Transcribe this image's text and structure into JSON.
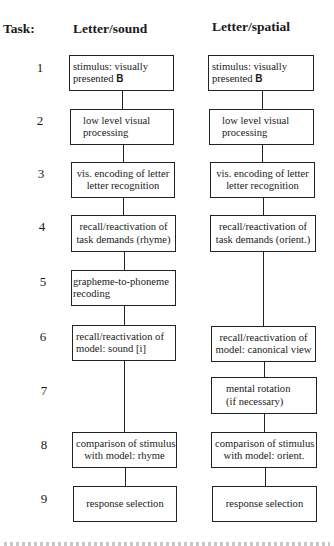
{
  "headers": {
    "task": "Task:",
    "left_column": "Letter/sound",
    "right_column": "Letter/spatial"
  },
  "task_numbers": [
    "1",
    "2",
    "3",
    "4",
    "5",
    "6",
    "7",
    "8",
    "9"
  ],
  "left_column_steps": [
    {
      "task": "1",
      "line1": "stimulus:  visually",
      "line2_prefix": "presented ",
      "line2_bold": "B"
    },
    {
      "task": "2",
      "line1": "low  level  visual",
      "line2": "processing"
    },
    {
      "task": "3",
      "line1": "vis. encoding of letter",
      "line2": "letter  recognition"
    },
    {
      "task": "4",
      "line1": "recall/reactivation  of",
      "line2": "task demands (rhyme)"
    },
    {
      "task": "5",
      "line1": "grapheme-to-phoneme",
      "line2": "recoding"
    },
    {
      "task": "6",
      "line1": "recall/reactivation   of",
      "line2": "model: sound [i]"
    },
    {
      "task": "8",
      "line1": "comparison of stimulus",
      "line2": "with model:  rhyme"
    },
    {
      "task": "9",
      "line1": "response selection"
    }
  ],
  "right_column_steps": [
    {
      "task": "1",
      "line1": "stimulus:  visually",
      "line2_prefix": "presented ",
      "line2_bold": "B"
    },
    {
      "task": "2",
      "line1": "low  level  visual",
      "line2": "processing"
    },
    {
      "task": "3",
      "line1": "vis. encoding of letter",
      "line2": "letter  recognition"
    },
    {
      "task": "4",
      "line1": "recall/reactivation  of",
      "line2": "task demands (orient.)"
    },
    {
      "task": "6",
      "line1": "recall/reactivation  of",
      "line2": "model: canonical view"
    },
    {
      "task": "7",
      "line1": "mental  rotation",
      "line2": "(if  necessary)"
    },
    {
      "task": "8",
      "line1": "comparison of stimulus",
      "line2": "with model: orient."
    },
    {
      "task": "9",
      "line1": "response selection"
    }
  ],
  "colors": {
    "line": "#222222",
    "text": "#1a1a1a",
    "background": "#ffffff"
  }
}
